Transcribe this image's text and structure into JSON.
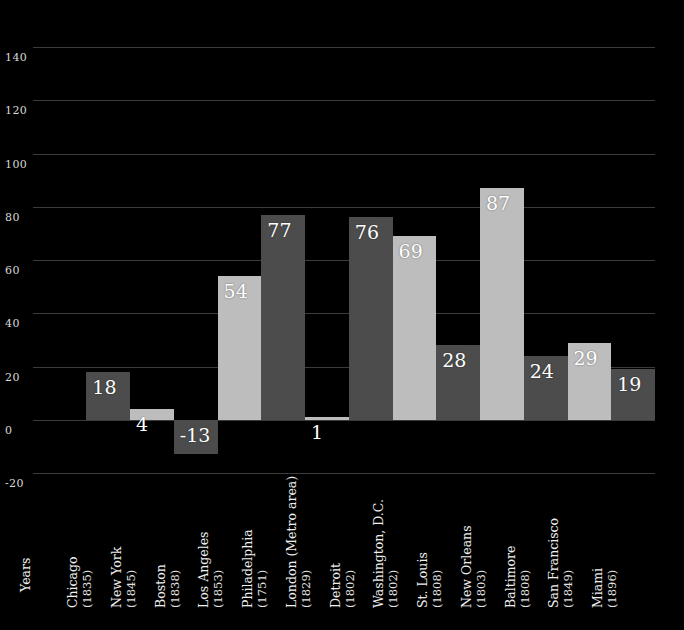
{
  "chart_data": {
    "type": "bar",
    "title": "",
    "subtitle": "",
    "xlabel": "Years",
    "ylabel": "",
    "ylim": [
      -20,
      140
    ],
    "grid": true,
    "legend": false,
    "ytick_labels": [
      "140",
      "120",
      "100",
      "80",
      "60",
      "40",
      "20",
      "0",
      "-20"
    ],
    "ytick_values": [
      140,
      120,
      100,
      80,
      60,
      40,
      20,
      0,
      -20
    ],
    "categories": [
      "Chicago",
      "New York",
      "Boston",
      "Los Angeles",
      "Philadelphia",
      "London (Metro area)",
      "Detroit",
      "Washington, D.C.",
      "St. Louis",
      "New Orleans",
      "Baltimore",
      "San Francisco",
      "Miami"
    ],
    "category_years": [
      "(1835)",
      "(1845)",
      "(1838)",
      "(1853)",
      "(1751)",
      "(1829)",
      "(1802)",
      "(1802)",
      "(1808)",
      "(1803)",
      "(1808)",
      "(1849)",
      "(1896)"
    ],
    "values": [
      18,
      4,
      -13,
      54,
      77,
      1,
      76,
      69,
      28,
      87,
      24,
      29,
      19
    ],
    "value_labels": [
      "18",
      "4",
      "-13",
      "54",
      "77",
      "1",
      "76",
      "69",
      "28",
      "87",
      "24",
      "29",
      "19"
    ],
    "bar_shades": [
      "dark",
      "light",
      "dark",
      "light",
      "dark",
      "light",
      "dark",
      "light",
      "dark",
      "light",
      "dark",
      "light",
      "dark"
    ],
    "colors": {
      "background": "#000000",
      "bar_dark": "#4c4c4c",
      "bar_light": "#bdbdbd",
      "gridline": "#3b3b3b",
      "text": "#ffffff",
      "tick_text": "#d8d8d8"
    }
  }
}
